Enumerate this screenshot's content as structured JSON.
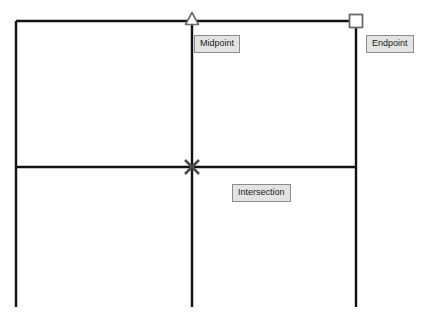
{
  "canvas": {
    "width": 426,
    "height": 325,
    "background_color": "#ffffff",
    "line_color": "#111111",
    "line_width": 2.4
  },
  "drawing": {
    "description": "CAD object snap demonstration on an orthogonal line grid",
    "lines": [
      {
        "name": "top-horizontal-line",
        "x1": 16,
        "y1": 21,
        "x2": 356,
        "y2": 21
      },
      {
        "name": "left-vertical-line",
        "x1": 16,
        "y1": 21,
        "x2": 16,
        "y2": 307
      },
      {
        "name": "middle-vertical-line",
        "x1": 192,
        "y1": 21,
        "x2": 192,
        "y2": 307
      },
      {
        "name": "right-vertical-line",
        "x1": 356,
        "y1": 21,
        "x2": 356,
        "y2": 307
      },
      {
        "name": "middle-horizontal-line",
        "x1": 16,
        "y1": 167,
        "x2": 356,
        "y2": 167
      }
    ]
  },
  "snap_markers": [
    {
      "id": "midpoint",
      "glyph": "triangle",
      "label": "Midpoint",
      "x": 192,
      "y": 21,
      "size": 11,
      "stroke_color": "#6b6b6b"
    },
    {
      "id": "endpoint",
      "glyph": "square",
      "label": "Endpoint",
      "x": 356,
      "y": 21,
      "size": 11,
      "stroke_color": "#6b6b6b"
    },
    {
      "id": "intersection",
      "glyph": "cross-x",
      "label": "Intersection",
      "x": 192,
      "y": 167,
      "size": 13,
      "stroke_color": "#4a4a4a"
    }
  ],
  "labels": {
    "midpoint": "Midpoint",
    "endpoint": "Endpoint",
    "intersection": "Intersection",
    "background_color": "#e3e3e3",
    "border_color": "#8c8c8c",
    "text_color": "#1a1a1a"
  },
  "footer": {
    "caption": ""
  }
}
